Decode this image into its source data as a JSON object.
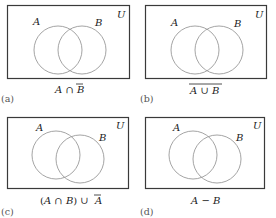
{
  "figure": {
    "panels": [
      {
        "id": "(a)",
        "universe_label": "U",
        "set_a_label": "A",
        "set_b_label": "B",
        "caption_parts": [
          "A",
          " ∩ ",
          "B"
        ],
        "caption_text": "A ∩ B̄"
      },
      {
        "id": "(b)",
        "universe_label": "U",
        "set_a_label": "A",
        "set_b_label": "B",
        "caption_parts": [
          "A",
          " ∪ ",
          "B"
        ],
        "caption_text": "complement of (A ∪ B)"
      },
      {
        "id": "(c)",
        "universe_label": "U",
        "set_a_label": "A",
        "set_b_label": "B",
        "caption_parts": [
          "(",
          "A",
          " ∩ ",
          "B",
          ") ∪ ",
          "A"
        ],
        "caption_text": "(A ∩ B) ∪ Ā"
      },
      {
        "id": "(d)",
        "universe_label": "U",
        "set_a_label": "A",
        "set_b_label": "B",
        "caption_parts": [
          "A",
          " − ",
          "B"
        ],
        "caption_text": "A − B"
      }
    ],
    "colors": {
      "frame": "#3a3a3a",
      "circle": "#9a9a9a",
      "text": "#222222"
    }
  }
}
